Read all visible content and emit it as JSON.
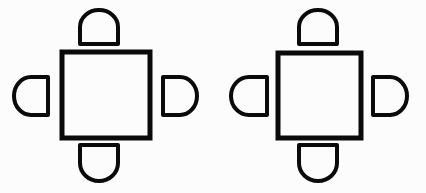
{
  "figure": {
    "background_color": "#fcfcfc",
    "ink_color": "#0a0a0a",
    "canvas": {
      "width": 426,
      "height": 193
    },
    "group_count": 2,
    "chairs_per_group": 4
  },
  "groups": [
    {
      "id": "group-left",
      "label": "Arrangement 1",
      "table": {
        "name": "square-table",
        "shape": "square",
        "x": 62,
        "y": 52,
        "width": 88,
        "height": 86,
        "stroke_width": 5,
        "fill": "none"
      },
      "chairs": [
        {
          "id": "chair-top",
          "label": "Top seat",
          "position": "top",
          "flat_edge": "bottom",
          "cx": 99,
          "cy": 27,
          "rx": 19,
          "ry": 17
        },
        {
          "id": "chair-left",
          "label": "Left seat",
          "position": "left",
          "flat_edge": "right",
          "cx": 31,
          "cy": 96,
          "rx": 17,
          "ry": 19
        },
        {
          "id": "chair-right",
          "label": "Right seat",
          "position": "right",
          "flat_edge": "left",
          "cx": 180,
          "cy": 96,
          "rx": 17,
          "ry": 19
        },
        {
          "id": "chair-bottom",
          "label": "Bottom seat",
          "position": "bottom",
          "flat_edge": "top",
          "cx": 99,
          "cy": 163,
          "rx": 19,
          "ry": 18
        }
      ]
    },
    {
      "id": "group-right",
      "label": "Arrangement 2",
      "table": {
        "name": "square-table",
        "shape": "square",
        "x": 278,
        "y": 53,
        "width": 83,
        "height": 85,
        "stroke_width": 5,
        "fill": "none"
      },
      "chairs": [
        {
          "id": "chair-top",
          "label": "Top seat",
          "position": "top",
          "flat_edge": "bottom",
          "cx": 318,
          "cy": 27,
          "rx": 19,
          "ry": 17
        },
        {
          "id": "chair-left",
          "label": "Left seat",
          "position": "left",
          "flat_edge": "right",
          "cx": 249,
          "cy": 96,
          "rx": 18,
          "ry": 19
        },
        {
          "id": "chair-right",
          "label": "Right seat",
          "position": "right",
          "flat_edge": "left",
          "cx": 390,
          "cy": 96,
          "rx": 17,
          "ry": 19
        },
        {
          "id": "chair-bottom",
          "label": "Bottom seat",
          "position": "bottom",
          "flat_edge": "top",
          "cx": 318,
          "cy": 163,
          "rx": 19,
          "ry": 18
        }
      ]
    }
  ],
  "stroke": {
    "table_width": 5,
    "chair_width": 4
  }
}
